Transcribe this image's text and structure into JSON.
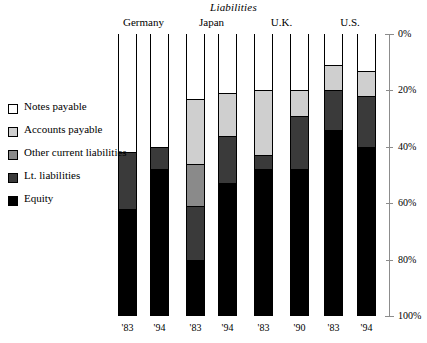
{
  "chart_data": {
    "type": "bar",
    "subtype": "stacked-percentage-column",
    "title": "Liabilities",
    "xlabel": "",
    "ylabel": "",
    "ylim": [
      0,
      100
    ],
    "y_inverted": true,
    "grid": false,
    "legend_position": "left",
    "axis_ticks": [
      "0%",
      "20%",
      "40%",
      "60%",
      "80%",
      "100%"
    ],
    "axis_tick_values": [
      0,
      20,
      40,
      60,
      80,
      100
    ],
    "groups": [
      "Germany",
      "Japan",
      "U.K.",
      "U.S."
    ],
    "categories": [
      "'83",
      "'94",
      "'83",
      "'94",
      "'83",
      "'90",
      "'83",
      "'94"
    ],
    "series": [
      {
        "name": "Notes payable",
        "color": "#ffffff",
        "values": [
          42,
          40,
          23,
          21,
          20,
          20,
          11,
          13
        ]
      },
      {
        "name": "Accounts payable",
        "color": "#cfcfcf",
        "values": [
          0,
          0,
          23,
          15,
          23,
          9,
          9,
          9
        ]
      },
      {
        "name": "Other current liabilities",
        "color": "#8a8a8a",
        "values": [
          0,
          0,
          15,
          0,
          0,
          0,
          0,
          0
        ]
      },
      {
        "name": "Lt. liabilities",
        "color": "#3a3a3a",
        "values": [
          20,
          8,
          19,
          17,
          5,
          19,
          14,
          18
        ]
      },
      {
        "name": "Equity",
        "color": "#000000",
        "values": [
          38,
          52,
          20,
          47,
          52,
          52,
          66,
          60
        ]
      }
    ],
    "bars": [
      {
        "group": "Germany",
        "year": "'83",
        "stack": [
          {
            "series": "Notes payable",
            "start": 0,
            "end": 42
          },
          {
            "series": "Lt. liabilities",
            "start": 42,
            "end": 62
          },
          {
            "series": "Equity",
            "start": 62,
            "end": 100
          }
        ]
      },
      {
        "group": "Germany",
        "year": "'94",
        "stack": [
          {
            "series": "Notes payable",
            "start": 0,
            "end": 40
          },
          {
            "series": "Lt. liabilities",
            "start": 40,
            "end": 48
          },
          {
            "series": "Equity",
            "start": 48,
            "end": 100
          }
        ]
      },
      {
        "group": "Japan",
        "year": "'83",
        "stack": [
          {
            "series": "Notes payable",
            "start": 0,
            "end": 23
          },
          {
            "series": "Accounts payable",
            "start": 23,
            "end": 46
          },
          {
            "series": "Other current liabilities",
            "start": 46,
            "end": 61
          },
          {
            "series": "Lt. liabilities",
            "start": 61,
            "end": 80
          },
          {
            "series": "Equity",
            "start": 80,
            "end": 100
          }
        ]
      },
      {
        "group": "Japan",
        "year": "'94",
        "stack": [
          {
            "series": "Notes payable",
            "start": 0,
            "end": 21
          },
          {
            "series": "Accounts payable",
            "start": 21,
            "end": 36
          },
          {
            "series": "Lt. liabilities",
            "start": 36,
            "end": 53
          },
          {
            "series": "Equity",
            "start": 53,
            "end": 100
          }
        ]
      },
      {
        "group": "U.K.",
        "year": "'83",
        "stack": [
          {
            "series": "Notes payable",
            "start": 0,
            "end": 20
          },
          {
            "series": "Accounts payable",
            "start": 20,
            "end": 43
          },
          {
            "series": "Lt. liabilities",
            "start": 43,
            "end": 48
          },
          {
            "series": "Equity",
            "start": 48,
            "end": 100
          }
        ]
      },
      {
        "group": "U.K.",
        "year": "'90",
        "stack": [
          {
            "series": "Notes payable",
            "start": 0,
            "end": 20
          },
          {
            "series": "Accounts payable",
            "start": 20,
            "end": 29
          },
          {
            "series": "Lt. liabilities",
            "start": 29,
            "end": 48
          },
          {
            "series": "Equity",
            "start": 48,
            "end": 100
          }
        ]
      },
      {
        "group": "U.S.",
        "year": "'83",
        "stack": [
          {
            "series": "Notes payable",
            "start": 0,
            "end": 11
          },
          {
            "series": "Accounts payable",
            "start": 11,
            "end": 20
          },
          {
            "series": "Lt. liabilities",
            "start": 20,
            "end": 34
          },
          {
            "series": "Equity",
            "start": 34,
            "end": 100
          }
        ]
      },
      {
        "group": "U.S.",
        "year": "'94",
        "stack": [
          {
            "series": "Notes payable",
            "start": 0,
            "end": 13
          },
          {
            "series": "Accounts payable",
            "start": 13,
            "end": 22
          },
          {
            "series": "Lt. liabilities",
            "start": 22,
            "end": 40
          },
          {
            "series": "Equity",
            "start": 40,
            "end": 100
          }
        ]
      }
    ]
  },
  "legend": {
    "items": [
      {
        "label": "Notes payable",
        "color": "#ffffff"
      },
      {
        "label": "Accounts payable",
        "color": "#cfcfcf"
      },
      {
        "label": "Other current liabilities",
        "color": "#8a8a8a"
      },
      {
        "label": "Lt. liabilities",
        "color": "#3a3a3a"
      },
      {
        "label": "Equity",
        "color": "#000000"
      }
    ]
  },
  "axis": {
    "labels": [
      "0%",
      "20%",
      "40%",
      "60%",
      "80%",
      "100%"
    ]
  },
  "groups": [
    {
      "label": "Germany"
    },
    {
      "label": "Japan"
    },
    {
      "label": "U.K."
    },
    {
      "label": "U.S."
    }
  ],
  "years": [
    "'83",
    "'94",
    "'83",
    "'94",
    "'83",
    "'90",
    "'83",
    "'94"
  ]
}
